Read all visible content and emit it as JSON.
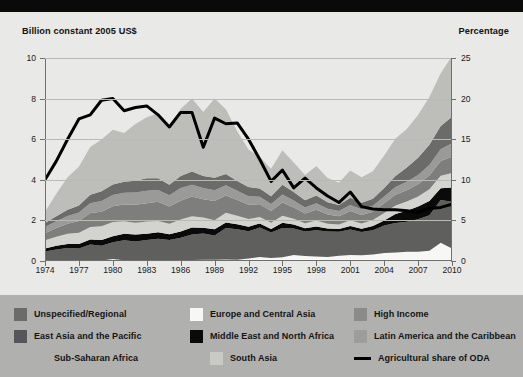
{
  "chart_data": {
    "type": "area",
    "title": "",
    "subtitle": "",
    "left_axis_label": "Billion constant 2005 US$",
    "right_axis_label": "Percentage",
    "xlabel": "",
    "ylabel": "Billion constant 2005 US$",
    "y2label": "Percentage",
    "ylim": [
      0,
      10
    ],
    "y2lim": [
      0,
      25
    ],
    "y_ticks": [
      "0",
      "2",
      "4",
      "6",
      "8",
      "10"
    ],
    "y2_ticks": [
      "0",
      "5",
      "10",
      "15",
      "20",
      "25"
    ],
    "grid": true,
    "legend_position": "bottom",
    "x": [
      1974,
      1975,
      1976,
      1977,
      1978,
      1979,
      1980,
      1981,
      1982,
      1983,
      1984,
      1985,
      1986,
      1987,
      1988,
      1989,
      1990,
      1991,
      1992,
      1993,
      1994,
      1995,
      1996,
      1997,
      1998,
      1999,
      2000,
      2001,
      2002,
      2003,
      2004,
      2005,
      2006,
      2007,
      2008,
      2009,
      2010
    ],
    "x_tick_labels": [
      "1974",
      "1977",
      "1980",
      "1983",
      "1986",
      "1989",
      "1992",
      "1995",
      "1998",
      "2001",
      "2004",
      "2007",
      "2010"
    ],
    "stacked": true,
    "stack_order": [
      "Europe and Central Asia",
      "Sub-Saharan Africa",
      "Middle East and North Africa",
      "South Asia",
      "East Asia and the Pacific",
      "Latin America and the Caribbean",
      "Unspecified/Regional",
      "High Income"
    ],
    "series": [
      {
        "name": "Europe and Central Asia",
        "color": "#f7f7f5",
        "values": [
          0.02,
          0.02,
          0.02,
          0.02,
          0.03,
          0.03,
          0.1,
          0.04,
          0.04,
          0.04,
          0.05,
          0.04,
          0.05,
          0.05,
          0.06,
          0.06,
          0.07,
          0.06,
          0.12,
          0.2,
          0.15,
          0.18,
          0.3,
          0.25,
          0.22,
          0.2,
          0.26,
          0.3,
          0.28,
          0.32,
          0.4,
          0.42,
          0.45,
          0.46,
          0.5,
          0.9,
          0.62
        ]
      },
      {
        "name": "Sub-Saharan Africa",
        "color": "#5f5f5e",
        "values": [
          0.45,
          0.55,
          0.62,
          0.6,
          0.78,
          0.72,
          0.82,
          0.98,
          0.92,
          1.0,
          1.05,
          1.0,
          1.1,
          1.25,
          1.3,
          1.2,
          1.55,
          1.5,
          1.35,
          1.45,
          1.25,
          1.45,
          1.3,
          1.2,
          1.3,
          1.25,
          1.18,
          1.25,
          1.15,
          1.2,
          1.35,
          1.45,
          1.48,
          1.6,
          1.75,
          2.1,
          2.3
        ]
      },
      {
        "name": "Middle East and North Africa",
        "color": "#0a0a0a",
        "values": [
          0.15,
          0.18,
          0.2,
          0.22,
          0.25,
          0.28,
          0.3,
          0.32,
          0.35,
          0.3,
          0.32,
          0.28,
          0.3,
          0.35,
          0.28,
          0.3,
          0.28,
          0.25,
          0.22,
          0.2,
          0.18,
          0.25,
          0.2,
          0.16,
          0.18,
          0.15,
          0.14,
          0.18,
          0.16,
          0.2,
          0.25,
          0.45,
          0.55,
          0.62,
          0.7,
          0.58,
          0.7
        ]
      },
      {
        "name": "South Asia",
        "color": "#d3d3cf",
        "values": [
          0.4,
          0.45,
          0.5,
          0.55,
          0.62,
          0.68,
          0.7,
          0.62,
          0.58,
          0.6,
          0.55,
          0.52,
          0.6,
          0.55,
          0.5,
          0.45,
          0.48,
          0.42,
          0.38,
          0.32,
          0.3,
          0.35,
          0.28,
          0.25,
          0.3,
          0.24,
          0.22,
          0.28,
          0.26,
          0.3,
          0.36,
          0.42,
          0.45,
          0.5,
          0.58,
          0.62,
          0.72
        ]
      },
      {
        "name": "East Asia and the Pacific",
        "color": "#7e7e7c",
        "values": [
          0.35,
          0.42,
          0.5,
          0.58,
          0.68,
          0.72,
          0.78,
          0.82,
          0.88,
          0.9,
          0.95,
          0.85,
          0.92,
          0.98,
          0.9,
          0.95,
          0.85,
          0.78,
          0.7,
          0.62,
          0.58,
          0.65,
          0.55,
          0.48,
          0.52,
          0.45,
          0.4,
          0.45,
          0.42,
          0.4,
          0.48,
          0.52,
          0.55,
          0.6,
          0.68,
          0.72,
          0.8
        ]
      },
      {
        "name": "Latin America and the Caribbean",
        "color": "#9a9a98",
        "values": [
          0.3,
          0.34,
          0.38,
          0.42,
          0.48,
          0.52,
          0.55,
          0.58,
          0.6,
          0.62,
          0.58,
          0.55,
          0.62,
          0.58,
          0.55,
          0.52,
          0.5,
          0.45,
          0.42,
          0.38,
          0.35,
          0.4,
          0.35,
          0.3,
          0.33,
          0.28,
          0.26,
          0.3,
          0.28,
          0.3,
          0.34,
          0.38,
          0.42,
          0.46,
          0.52,
          0.58,
          0.66
        ]
      },
      {
        "name": "Unspecified/Regional",
        "color": "#6b6b69",
        "values": [
          0.2,
          0.25,
          0.3,
          0.35,
          0.42,
          0.48,
          0.52,
          0.55,
          0.58,
          0.62,
          0.58,
          0.52,
          0.6,
          0.65,
          0.6,
          0.62,
          0.55,
          0.48,
          0.45,
          0.4,
          0.38,
          0.48,
          0.42,
          0.35,
          0.38,
          0.32,
          0.3,
          0.35,
          0.32,
          0.35,
          0.42,
          0.55,
          0.7,
          0.85,
          1.0,
          1.15,
          1.3
        ]
      },
      {
        "name": "High Income",
        "color": "#bdbdba",
        "values": [
          0.55,
          1.1,
          1.6,
          1.9,
          2.35,
          2.55,
          2.7,
          2.4,
          2.8,
          3.0,
          3.2,
          2.85,
          3.3,
          3.6,
          3.15,
          3.9,
          3.2,
          2.45,
          1.85,
          1.55,
          1.35,
          1.7,
          1.45,
          1.25,
          1.45,
          1.2,
          1.1,
          1.35,
          1.25,
          1.35,
          1.6,
          1.85,
          1.9,
          2.1,
          2.35,
          2.6,
          3.0
        ]
      }
    ],
    "line_series": {
      "name": "Agricultural share of ODA",
      "color": "#000000",
      "axis": "right",
      "unit": "percent",
      "values": [
        10.0,
        12.3,
        15.0,
        17.5,
        18.0,
        19.8,
        20.0,
        18.5,
        18.9,
        19.1,
        18.0,
        16.5,
        18.3,
        18.3,
        14.0,
        17.6,
        16.9,
        17.0,
        15.0,
        12.5,
        9.8,
        11.2,
        9.0,
        10.2,
        9.0,
        8.0,
        7.2,
        8.5,
        6.7,
        6.4,
        6.3,
        6.3,
        6.2,
        6.0,
        6.5,
        6.6,
        7.0
      ]
    }
  },
  "axis_titles": {
    "left": "Billion constant 2005 US$",
    "right": "Percentage"
  },
  "legend": {
    "rows": [
      [
        {
          "label": "Unspecified/Regional",
          "color": "#6b6b69",
          "kind": "swatch"
        },
        {
          "label": "Europe and Central Asia",
          "color": "#f7f7f5",
          "kind": "swatch"
        },
        {
          "label": "High Income",
          "color": "#8b8b89",
          "kind": "swatch"
        }
      ],
      [
        {
          "label": "East Asia and the Pacific",
          "color": "#55555a",
          "kind": "swatch"
        },
        {
          "label": "Middle East and North Africa",
          "color": "#0a0a0a",
          "kind": "swatch"
        },
        {
          "label": "Latin America and the Caribbean",
          "color": "#9d9d9b",
          "kind": "swatch"
        }
      ],
      [
        {
          "label": "Sub-Saharan Africa",
          "color": "#b0b0ae",
          "kind": "swatch"
        },
        {
          "label": "South Asia",
          "color": "#c9c9c6",
          "kind": "swatch"
        },
        {
          "label": "Agricultural share of ODA",
          "color": "#000000",
          "kind": "line"
        }
      ]
    ]
  }
}
